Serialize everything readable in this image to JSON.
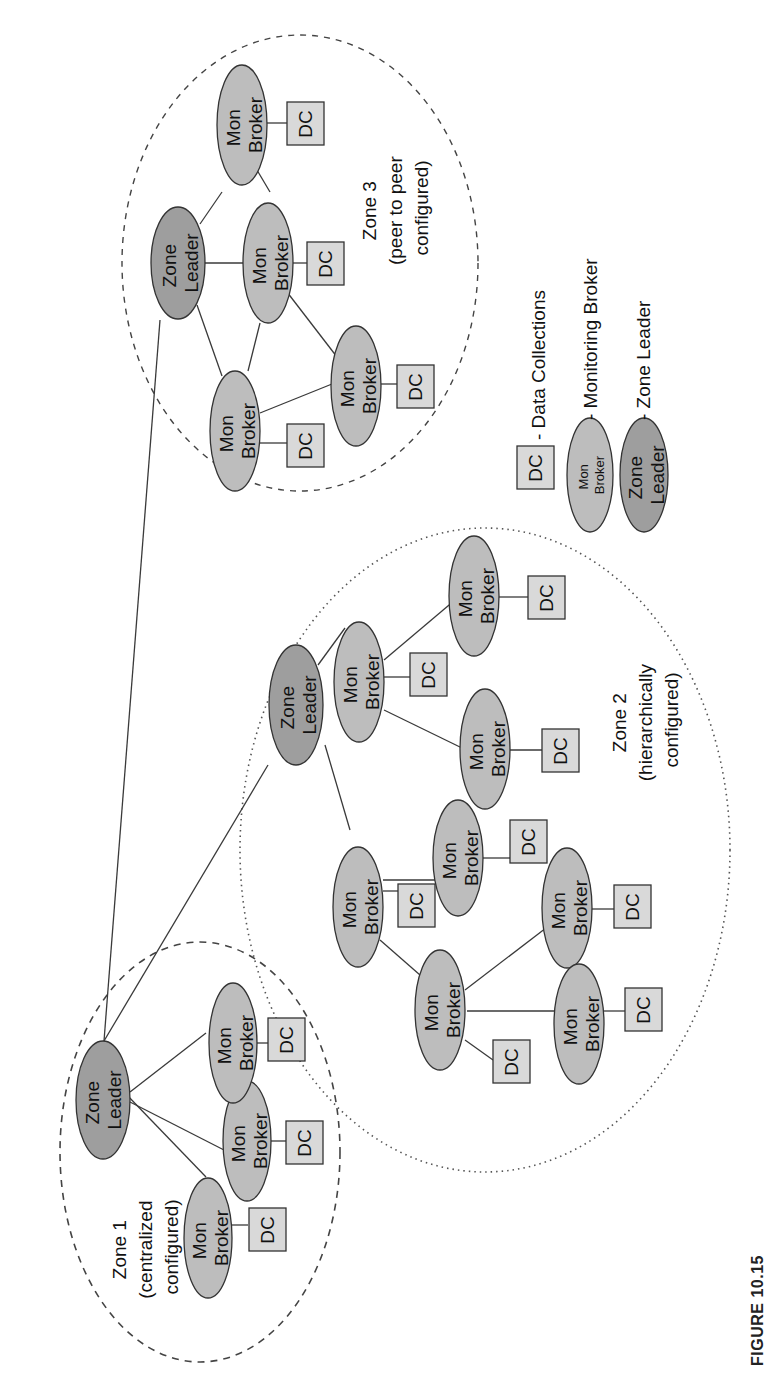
{
  "figure": {
    "caption": "FIGURE 10.15",
    "orientation": "rotated 90° counterclockwise"
  },
  "labels": {
    "mon_broker_line1": "Mon",
    "mon_broker_line2": "Broker",
    "zone_leader_line1": "Zone",
    "zone_leader_line2": "Leader",
    "dc": "DC"
  },
  "zones": [
    {
      "id": "zone1",
      "title": "Zone 1",
      "subtitle_line1": "(centralized",
      "subtitle_line2": "configured)",
      "boundary_style": "dashed",
      "leader_count": 1,
      "broker_count": 3,
      "dc_count": 3
    },
    {
      "id": "zone2",
      "title": "Zone 2",
      "subtitle_line1": "(hierarchically",
      "subtitle_line2": "configured)",
      "boundary_style": "dotted",
      "leader_count": 1,
      "broker_count": 8,
      "dc_count": 8
    },
    {
      "id": "zone3",
      "title": "Zone 3",
      "subtitle_line1": "(peer to peer",
      "subtitle_line2": "configured)",
      "boundary_style": "dashed",
      "leader_count": 1,
      "broker_count": 4,
      "dc_count": 4
    }
  ],
  "legend": {
    "items": [
      {
        "symbol": "DC",
        "description": "- Data Collections"
      },
      {
        "symbol_line1": "Mon",
        "symbol_line2": "Broker",
        "description": "- Monitoring Broker"
      },
      {
        "symbol_line1": "Zone",
        "symbol_line2": "Leader",
        "description": "- Zone Leader"
      }
    ]
  },
  "colors": {
    "zone_leader_fill": "#9e9e9e",
    "mon_broker_fill": "#bdbdbd",
    "dc_fill": "#d9d9d9",
    "stroke": "#333333"
  }
}
